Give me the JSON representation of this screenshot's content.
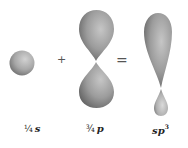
{
  "figure": {
    "operators": {
      "plus": "+",
      "equals": "="
    },
    "labels": {
      "s": {
        "fraction": "¼",
        "symbol": "s"
      },
      "p": {
        "fraction": "¾",
        "symbol": "p"
      },
      "hybrid": {
        "symbol": "sp",
        "superscript": "3"
      }
    },
    "orbitals": [
      {
        "name": "s orbital",
        "shape": "sphere"
      },
      {
        "name": "p orbital",
        "shape": "two equal lobes"
      },
      {
        "name": "sp3 hybrid orbital",
        "shape": "one large lobe, one small lobe"
      }
    ],
    "colors": {
      "lobe_light": "#c8c8c8",
      "lobe_mid": "#9a9a9a",
      "lobe_dark": "#5e5e5e",
      "text": "#222222"
    }
  }
}
